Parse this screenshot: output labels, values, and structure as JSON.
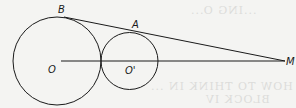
{
  "diagram": {
    "type": "geometry",
    "colors": {
      "stroke": "#1a1a1a",
      "background": "#f4f4f2",
      "ghost_text": "#dcdcda"
    },
    "points": {
      "O": {
        "label": "O",
        "x": 57,
        "y": 61
      },
      "O_prime": {
        "label": "O'",
        "x": 129.5,
        "y": 61
      },
      "B": {
        "label": "B",
        "x": 64,
        "y": 17
      },
      "A": {
        "label": "A",
        "x": 133,
        "y": 32.5
      },
      "M": {
        "label": "M",
        "x": 285,
        "y": 61
      }
    },
    "circles": [
      {
        "name": "circle-O",
        "cx": 57,
        "cy": 61,
        "r": 44
      },
      {
        "name": "circle-O-prime",
        "cx": 129.5,
        "cy": 61,
        "r": 28.5
      }
    ],
    "segments": [
      {
        "name": "tangent-BM",
        "from": "B",
        "to": "M"
      },
      {
        "name": "center-line-OM",
        "from": "O",
        "to": "M"
      }
    ],
    "labels": {
      "B": "B",
      "A": "A",
      "O": "O",
      "O_prime": "O'",
      "M": "M"
    },
    "bleed_through_text": [
      "HOW TO THINK IN ...",
      "BLOCK IV",
      "...ING O..."
    ]
  }
}
